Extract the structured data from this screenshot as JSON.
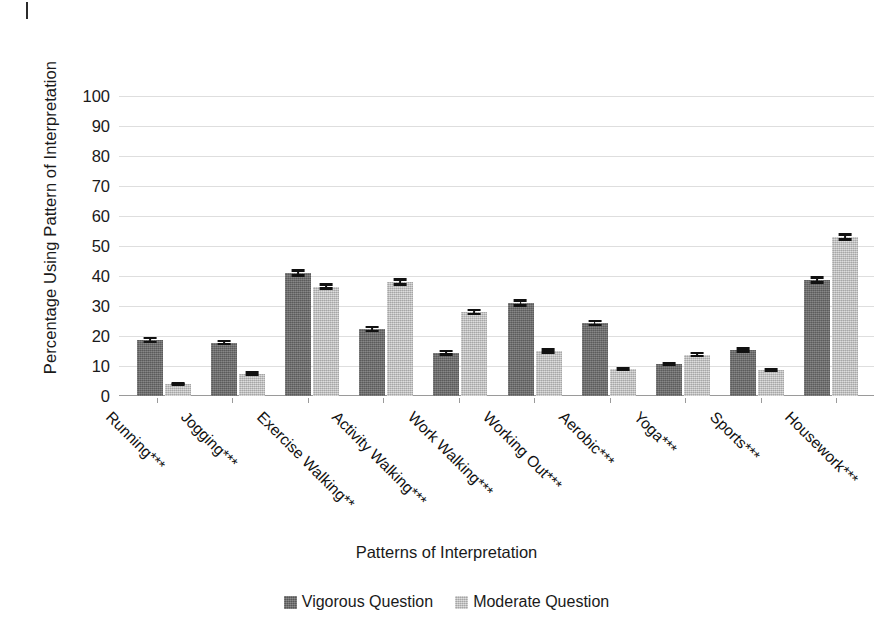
{
  "chart_data": {
    "type": "bar",
    "title": "",
    "xlabel": "Patterns of Interpretation",
    "ylabel": "Percentage Using Pattern of Interpretation",
    "ylim": [
      0,
      100
    ],
    "yticks": [
      0,
      10,
      20,
      30,
      40,
      50,
      60,
      70,
      80,
      90,
      100
    ],
    "grid": true,
    "legend_position": "bottom-center",
    "categories": [
      "Running***",
      "Jogging***",
      "Exercise Walking**",
      "Activity Walking***",
      "Work Walking***",
      "Working Out***",
      "Aerobic***",
      "Yoga***",
      "Sports***",
      "Housework***"
    ],
    "series": [
      {
        "name": "Vigorous Question",
        "color": "#6e6e6e",
        "values": [
          18.7,
          17.8,
          41.0,
          22.3,
          14.5,
          31.0,
          24.3,
          10.7,
          15.3,
          38.7
        ],
        "errors": [
          1.0,
          0.9,
          1.2,
          1.1,
          1.0,
          1.2,
          1.1,
          0.8,
          0.9,
          1.2
        ]
      },
      {
        "name": "Moderate Question",
        "color": "#c9c9c9",
        "values": [
          4.0,
          7.5,
          36.5,
          38.0,
          28.0,
          15.0,
          9.0,
          13.8,
          8.7,
          53.0
        ],
        "errors": [
          0.6,
          0.8,
          1.1,
          1.2,
          1.1,
          0.9,
          0.8,
          0.9,
          0.8,
          1.2
        ]
      }
    ]
  },
  "legend": {
    "items": [
      {
        "label": "Vigorous Question"
      },
      {
        "label": "Moderate Question"
      }
    ]
  }
}
